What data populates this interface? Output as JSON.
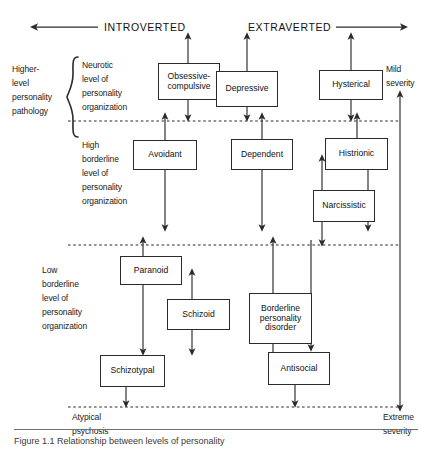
{
  "figure": {
    "top_axis": {
      "left_label": "INTROVERTED",
      "right_label": "EXTRAVERTED",
      "left_arrow_icon": "arrow-left-icon",
      "right_arrow_icon": "arrow-right-icon"
    },
    "severity_axis": {
      "top_label_line1": "Mild",
      "top_label_line2": "severity",
      "bottom_label_line1": "Extreme",
      "bottom_label_line2": "severity"
    },
    "left_bracket_label": {
      "line1": "Higher-",
      "line2": "level",
      "line3": "personality",
      "line4": "pathology"
    },
    "levels": [
      {
        "id": "neurotic",
        "lines": [
          "Neurotic",
          "level of",
          "personality",
          "organization"
        ]
      },
      {
        "id": "high-borderline",
        "lines": [
          "High",
          "borderline",
          "level of",
          "personality",
          "organization"
        ]
      },
      {
        "id": "low-borderline",
        "lines": [
          "Low",
          "borderline",
          "level of",
          "personality",
          "organization"
        ]
      }
    ],
    "bottom_label": {
      "line1": "Atypical",
      "line2": "psychosis"
    },
    "disorders": [
      {
        "id": "obsessive-compulsive",
        "label": "Obsessive-\ncompulsive",
        "line1": "Obsessive-",
        "line2": "compulsive"
      },
      {
        "id": "depressive",
        "label": "Depressive"
      },
      {
        "id": "hysterical",
        "label": "Hysterical"
      },
      {
        "id": "avoidant",
        "label": "Avoidant"
      },
      {
        "id": "dependent",
        "label": "Dependent"
      },
      {
        "id": "histrionic",
        "label": "Histrionic"
      },
      {
        "id": "narcissistic",
        "label": "Narcissistic"
      },
      {
        "id": "paranoid",
        "label": "Paranoid"
      },
      {
        "id": "schizoid",
        "label": "Schizoid"
      },
      {
        "id": "schizotypal",
        "label": "Schizotypal"
      },
      {
        "id": "borderline-personality-disorder",
        "line1": "Borderline",
        "line2": "personality",
        "line3": "disorder"
      },
      {
        "id": "antisocial",
        "label": "Antisocial"
      }
    ],
    "caption": "Figure 1.1   Relationship between levels of personality",
    "colors": {
      "line": "#2b2b2b",
      "text": "#111111",
      "rule": "#6f6f6f"
    }
  }
}
